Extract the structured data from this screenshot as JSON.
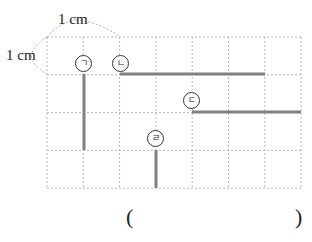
{
  "figure": {
    "grid": {
      "cols": 7,
      "rows": 4,
      "x0": 47,
      "y0": 37,
      "cell_w": 36.3,
      "cell_h": 37.8,
      "line_color": "#b8b8b8"
    },
    "scale_labels": {
      "horizontal": "1 cm",
      "vertical": "1 cm"
    },
    "segments": [
      {
        "label": "ㄱ",
        "orientation": "vertical",
        "x1": 84,
        "y1": 74,
        "x2": 84,
        "y2": 150
      },
      {
        "label": "ㄴ",
        "orientation": "horizontal",
        "x1": 120,
        "y1": 74,
        "x2": 265,
        "y2": 74
      },
      {
        "label": "ㄷ",
        "orientation": "horizontal",
        "x1": 192,
        "y1": 112,
        "x2": 301,
        "y2": 112
      },
      {
        "label": "ㄹ",
        "orientation": "vertical",
        "x1": 156,
        "y1": 150,
        "x2": 156,
        "y2": 188
      }
    ],
    "segment_color": "#808080",
    "markers": [
      {
        "text": "ㄱ",
        "x": 75,
        "y": 55
      },
      {
        "text": "ㄴ",
        "x": 112,
        "y": 55
      },
      {
        "text": "ㄷ",
        "x": 183,
        "y": 92
      },
      {
        "text": "ㄹ",
        "x": 147,
        "y": 130
      }
    ]
  },
  "answer": {
    "open": "(",
    "close": ")",
    "value": ""
  }
}
